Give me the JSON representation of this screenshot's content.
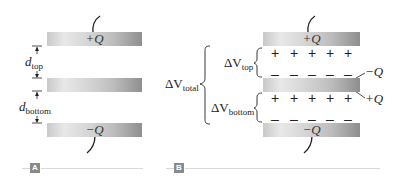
{
  "panels": [
    {
      "tag": "A",
      "plates": [
        {
          "label": "+Q"
        },
        {
          "label": ""
        },
        {
          "label": "−Q"
        }
      ],
      "dimensions": {
        "top": {
          "symbol": "d",
          "subscript": "top"
        },
        "bottom": {
          "symbol": "d",
          "subscript": "bottom"
        }
      }
    },
    {
      "tag": "B",
      "plates": [
        {
          "label": "+Q"
        },
        {
          "label": ""
        },
        {
          "label": "−Q"
        }
      ],
      "surface_charges": {
        "middle_top": "−Q",
        "middle_bottom": "+Q"
      },
      "voltages": {
        "total": {
          "symbol": "ΔV",
          "subscript": "total"
        },
        "top": {
          "symbol": "ΔV",
          "subscript": "top"
        },
        "bottom": {
          "symbol": "ΔV",
          "subscript": "bottom"
        }
      },
      "charge_symbols": {
        "plus": "+",
        "minus": "–"
      }
    }
  ],
  "colors": {
    "plate_light": "#e8e8e8",
    "plate_dark": "#8e8e8e",
    "tag_bg": "#8a8a8a",
    "rule": "#d8d8d8"
  }
}
